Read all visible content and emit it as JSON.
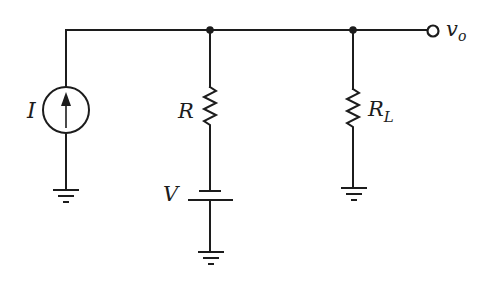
{
  "diagram": {
    "type": "circuit-schematic",
    "components": {
      "current_source": {
        "label": "I",
        "kind": "current-source",
        "direction": "up"
      },
      "resistor_r": {
        "label": "R",
        "kind": "resistor"
      },
      "battery": {
        "label": "V",
        "kind": "dc-voltage-source"
      },
      "load_resistor": {
        "label_main": "R",
        "label_sub": "L",
        "kind": "resistor"
      }
    },
    "output": {
      "label_main": "v",
      "label_sub": "o",
      "kind": "output-terminal"
    },
    "grounds": 3,
    "nodes": 2
  }
}
